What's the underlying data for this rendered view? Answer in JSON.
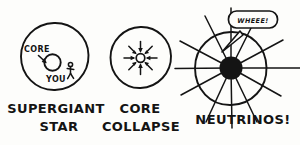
{
  "comic": {
    "title": "Supernova stages",
    "background_color": "#fdfdfb",
    "ink_color": "#141414",
    "panels": [
      {
        "id": "supergiant-star",
        "caption_line_1": "SUPERGIANT",
        "caption_line_2": "STAR",
        "annotations": {
          "core_label": "CORE",
          "observer_label": "YOU"
        },
        "elements": [
          "outer-star-circle",
          "core-circle",
          "core-arrow",
          "stick-figure"
        ]
      },
      {
        "id": "core-collapse",
        "caption_line_1": "CORE",
        "caption_line_2": "COLLAPSE",
        "annotations": {},
        "elements": [
          "outer-star-circle",
          "collapsing-core-circle",
          "inward-arrows"
        ],
        "inward_arrow_count": 8
      },
      {
        "id": "neutrinos",
        "caption_line_1": "NEUTRINOS!",
        "caption_line_2": "",
        "annotations": {
          "speech_bubble": "WHEEE!"
        },
        "elements": [
          "outer-star-circle",
          "black-core-disc",
          "radiating-neutrino-rays",
          "speech-bubble"
        ],
        "ray_count": 12
      }
    ]
  }
}
